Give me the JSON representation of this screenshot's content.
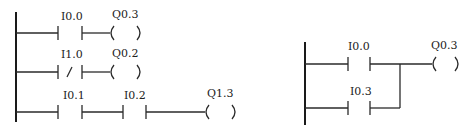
{
  "diagrams": [
    {
      "name": "left-ladder",
      "rungs": [
        {
          "contacts": [
            {
              "label": "I0.0",
              "type": "NO"
            }
          ],
          "coil": {
            "label": "Q0.3"
          }
        },
        {
          "contacts": [
            {
              "label": "I1.0",
              "type": "NC"
            }
          ],
          "coil": {
            "label": "Q0.2"
          }
        },
        {
          "contacts": [
            {
              "label": "I0.1",
              "type": "NO"
            },
            {
              "label": "I0.2",
              "type": "NO"
            }
          ],
          "coil": {
            "label": "Q1.3"
          }
        }
      ]
    },
    {
      "name": "right-ladder",
      "parallel_contacts": [
        {
          "label": "I0.0",
          "type": "NO"
        },
        {
          "label": "I0.3",
          "type": "NO"
        }
      ],
      "coil": {
        "label": "Q0.3"
      }
    }
  ],
  "symbols": {
    "nc_slash": "/",
    "coil_open": "(",
    "coil_close": ")"
  }
}
